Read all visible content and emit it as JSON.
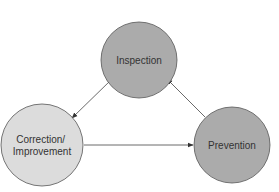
{
  "diagram": {
    "type": "cycle",
    "background": "#ffffff",
    "stroke_color": "#555555",
    "arrow_color": "#444444",
    "nodes": [
      {
        "id": "inspection",
        "label_lines": [
          "Inspection"
        ],
        "cx": 139,
        "cy": 60,
        "r": 38,
        "fill": "#ababab"
      },
      {
        "id": "correction",
        "label_lines": [
          "Correction/",
          "Improvement"
        ],
        "cx": 42,
        "cy": 145,
        "r": 41,
        "fill": "#dcdcdc"
      },
      {
        "id": "prevention",
        "label_lines": [
          "Prevention"
        ],
        "cx": 232,
        "cy": 145,
        "r": 38,
        "fill": "#ababab"
      }
    ],
    "edges": [
      {
        "from": "inspection",
        "to": "correction",
        "x1": 111,
        "y1": 80,
        "x2": 72,
        "y2": 118
      },
      {
        "from": "correction",
        "to": "prevention",
        "x1": 84,
        "y1": 145,
        "x2": 193,
        "y2": 145
      },
      {
        "from": "prevention",
        "to": "inspection",
        "x1": 205,
        "y1": 117,
        "x2": 167,
        "y2": 79
      }
    ]
  }
}
